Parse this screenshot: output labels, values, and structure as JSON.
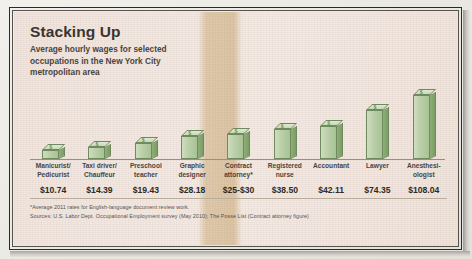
{
  "chart_data": {
    "type": "bar",
    "title": "Stacking Up",
    "subtitle": "Average hourly wages for selected occupations in the New York City metropolitan area",
    "xlabel": "",
    "ylabel": "Average hourly wage (USD)",
    "ylim": [
      0,
      110
    ],
    "grid": false,
    "legend": "none",
    "orientation": "vertical",
    "style": "3d-isometric-blocks",
    "bar_color": "#b4cb9f",
    "bar_top_color": "#d6e4c9",
    "bar_side_color": "#83a46d",
    "bar_outline_color": "#6f8a5d",
    "background_color": "#f2e7e0",
    "highlight_color": "#cdad7c",
    "categories": [
      "Manicurist/ Pedicurist",
      "Taxi driver/ Chauffeur",
      "Preschool teacher",
      "Graphic designer",
      "Contract attorney*",
      "Registered nurse",
      "Accountant",
      "Lawyer",
      "Anesthesi- ologist"
    ],
    "values": [
      10.74,
      14.39,
      19.43,
      28.18,
      27.5,
      38.5,
      42.11,
      74.35,
      108.04
    ],
    "value_labels": [
      "$10.74",
      "$14.39",
      "$19.43",
      "$28.18",
      "$25-$30",
      "$38.50",
      "$42.11",
      "$74.35",
      "$108.04"
    ],
    "highlighted_category": "Contract attorney*",
    "annotations": [
      "*Average 2011 rates for English-language document review work."
    ],
    "sources": "Sources: U.S. Labor Dept. Occupational Employment survey (May 2010); The Posse List (Contract attorney figure)"
  },
  "bars": [
    {
      "label_line1": "Manicurist/",
      "label_line2": "Pedicurist",
      "value_label": "$10.74",
      "height_px": 9,
      "highlight": false
    },
    {
      "label_line1": "Taxi driver/",
      "label_line2": "Chauffeur",
      "value_label": "$14.39",
      "height_px": 12,
      "highlight": false
    },
    {
      "label_line1": "Preschool",
      "label_line2": "teacher",
      "value_label": "$19.43",
      "height_px": 16,
      "highlight": false
    },
    {
      "label_line1": "Graphic",
      "label_line2": "designer",
      "value_label": "$28.18",
      "height_px": 23,
      "highlight": false
    },
    {
      "label_line1": "Contract",
      "label_line2": "attorney*",
      "value_label": "$25-$30",
      "height_px": 25,
      "highlight": true
    },
    {
      "label_line1": "Registered",
      "label_line2": "nurse",
      "value_label": "$38.50",
      "height_px": 30,
      "highlight": false
    },
    {
      "label_line1": "Accountant",
      "label_line2": "",
      "value_label": "$42.11",
      "height_px": 33,
      "highlight": false
    },
    {
      "label_line1": "Lawyer",
      "label_line2": "",
      "value_label": "$74.35",
      "height_px": 49,
      "highlight": false
    },
    {
      "label_line1": "Anesthesi-",
      "label_line2": "ologist",
      "value_label": "$108.04",
      "height_px": 64,
      "highlight": false
    }
  ],
  "footnotes": {
    "note": "*Average 2011 rates for English-language document review work.",
    "sources": "Sources: U.S. Labor Dept. Occupational Employment survey (May 2010); The Posse List (Contract attorney figure)"
  },
  "icons": {
    "dollar": "$"
  }
}
